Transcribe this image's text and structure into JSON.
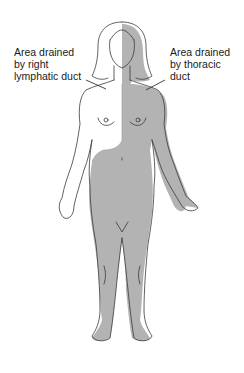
{
  "diagram": {
    "labels": {
      "left": [
        "Area drained",
        "by right",
        "lymphatic duct"
      ],
      "right": [
        "Area drained",
        "by thoracic",
        "duct"
      ]
    },
    "regions": [
      {
        "name": "right lymphatic duct drainage",
        "description": "right side of head, neck, right arm, right upper chest",
        "fill": "#ffffff"
      },
      {
        "name": "thoracic duct drainage",
        "description": "left side of head, neck, left arm, left chest, abdomen, both legs",
        "fill": "#b3b3b3"
      }
    ],
    "colors": {
      "shaded": "#b3b3b3",
      "outline": "#3a3a3a",
      "text": "#1a1a1a",
      "background": "#ffffff"
    }
  }
}
